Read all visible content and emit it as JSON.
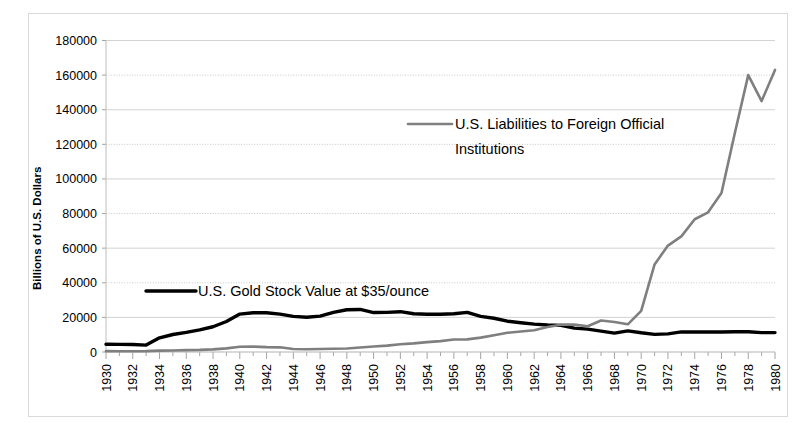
{
  "chart_data": {
    "type": "line",
    "title": "",
    "xlabel": "",
    "ylabel": "Billions of U.S. Dollars",
    "ylim": [
      0,
      180000
    ],
    "xlim": [
      1930,
      1980
    ],
    "y_ticks": [
      0,
      20000,
      40000,
      60000,
      80000,
      100000,
      120000,
      140000,
      160000,
      180000
    ],
    "y_tick_labels": [
      "0",
      "20000",
      "40000",
      "60000",
      "80000",
      "100000",
      "120000",
      "140000",
      "160000",
      "180000"
    ],
    "x_ticks": [
      1930,
      1932,
      1934,
      1936,
      1938,
      1940,
      1942,
      1944,
      1946,
      1948,
      1950,
      1952,
      1954,
      1956,
      1958,
      1960,
      1962,
      1964,
      1966,
      1968,
      1970,
      1972,
      1974,
      1976,
      1978,
      1980
    ],
    "x_tick_labels": [
      "1930",
      "1932",
      "1934",
      "1936",
      "1938",
      "1940",
      "1942",
      "1944",
      "1946",
      "1948",
      "1950",
      "1952",
      "1954",
      "1956",
      "1958",
      "1960",
      "1962",
      "1964",
      "1966",
      "1968",
      "1970",
      "1972",
      "1974",
      "1976",
      "1978",
      "1980"
    ],
    "grid": true,
    "legend_position": "inside-plot",
    "x": [
      1930,
      1931,
      1932,
      1933,
      1934,
      1935,
      1936,
      1937,
      1938,
      1939,
      1940,
      1941,
      1942,
      1943,
      1944,
      1945,
      1946,
      1947,
      1948,
      1949,
      1950,
      1951,
      1952,
      1953,
      1954,
      1955,
      1956,
      1957,
      1958,
      1959,
      1960,
      1961,
      1962,
      1963,
      1964,
      1965,
      1966,
      1967,
      1968,
      1969,
      1970,
      1971,
      1972,
      1973,
      1974,
      1975,
      1976,
      1977,
      1978,
      1979,
      1980
    ],
    "series": [
      {
        "name": "U.S. Gold Stock Value at $35/ounce",
        "color": "#000000",
        "width": 3.4,
        "values": [
          4500,
          4400,
          4300,
          4000,
          8200,
          10100,
          11300,
          12800,
          14600,
          17600,
          21900,
          22700,
          22700,
          21900,
          20600,
          20100,
          20700,
          22900,
          24400,
          24600,
          22800,
          22900,
          23300,
          22100,
          21800,
          21800,
          22100,
          22900,
          20600,
          19500,
          17800,
          16900,
          16100,
          15600,
          15400,
          13800,
          13200,
          12100,
          10900,
          12200,
          11100,
          10200,
          10500,
          11600,
          11600,
          11600,
          11600,
          11700,
          11700,
          11200,
          11200
        ],
        "legend_label": "U.S. Gold Stock Value at $35/ounce"
      },
      {
        "name": "U.S. Liabilities to Foreign Official Institutions",
        "color": "#7f7f7f",
        "width": 2.6,
        "values": [
          500,
          450,
          450,
          500,
          800,
          900,
          1100,
          1200,
          1500,
          2100,
          3000,
          3100,
          2800,
          2700,
          1700,
          1600,
          1700,
          1900,
          2000,
          2600,
          3200,
          3700,
          4500,
          5000,
          5700,
          6300,
          7200,
          7300,
          8300,
          9700,
          11100,
          11800,
          12600,
          14400,
          15800,
          15800,
          14900,
          18200,
          17300,
          16000,
          23800,
          50600,
          61500,
          66800,
          76700,
          80700,
          91900,
          126500,
          160000,
          145000,
          163000
        ],
        "legend_label": "U.S. Liabilities to Foreign Official Institutions"
      }
    ],
    "legend_entries": [
      {
        "label_line1": "U.S. Gold Stock Value at $35/ounce",
        "label_line2": "",
        "color": "#000000"
      },
      {
        "label_line1": "U.S. Liabilities to Foreign Official",
        "label_line2": "Institutions",
        "color": "#7f7f7f"
      }
    ]
  }
}
